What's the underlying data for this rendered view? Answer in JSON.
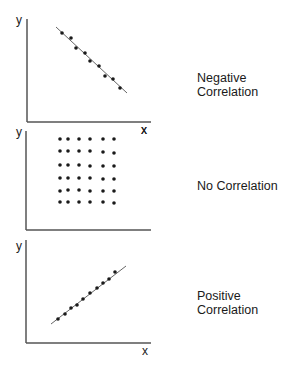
{
  "panels": [
    {
      "id": "negative",
      "caption_lines": [
        "Negative",
        "Correlation"
      ],
      "y_label": "y",
      "x_label": "x",
      "axis": {
        "x0": 27,
        "top": 19,
        "bottom": 122,
        "right": 151
      },
      "x_label_pos": [
        144,
        134
      ],
      "y_label_pos": [
        19,
        24
      ],
      "trend_line": [
        [
          56,
          27
        ],
        [
          127,
          93
        ]
      ],
      "points": [
        [
          62,
          33
        ],
        [
          71,
          38
        ],
        [
          76,
          48
        ],
        [
          85,
          53
        ],
        [
          90,
          61
        ],
        [
          99,
          66
        ],
        [
          105,
          76
        ],
        [
          113,
          79
        ],
        [
          120,
          88
        ]
      ],
      "caption_pos": [
        197,
        72
      ]
    },
    {
      "id": "none",
      "caption_lines": [
        "No Correlation"
      ],
      "y_label": "y",
      "x_label": "x",
      "axis": {
        "x0": 26,
        "top": 131,
        "bottom": 230,
        "right": 151
      },
      "x_label_pos": [
        144,
        134
      ],
      "y_label_pos": [
        19,
        136
      ],
      "points": [
        [
          60,
          139
        ],
        [
          68,
          139
        ],
        [
          79,
          139
        ],
        [
          90,
          139
        ],
        [
          103,
          139
        ],
        [
          114,
          139
        ],
        [
          60,
          151
        ],
        [
          68,
          151
        ],
        [
          79,
          151
        ],
        [
          90,
          151
        ],
        [
          103,
          152
        ],
        [
          114,
          153
        ],
        [
          60,
          165
        ],
        [
          68,
          165
        ],
        [
          79,
          165
        ],
        [
          90,
          166
        ],
        [
          103,
          166
        ],
        [
          114,
          166
        ],
        [
          60,
          178
        ],
        [
          68,
          178
        ],
        [
          79,
          178
        ],
        [
          90,
          178
        ],
        [
          103,
          179
        ],
        [
          114,
          179
        ],
        [
          60,
          191
        ],
        [
          68,
          190
        ],
        [
          79,
          190
        ],
        [
          90,
          191
        ],
        [
          103,
          191
        ],
        [
          114,
          191
        ],
        [
          60,
          202
        ],
        [
          68,
          202
        ],
        [
          79,
          202
        ],
        [
          90,
          202
        ],
        [
          103,
          202
        ],
        [
          114,
          203
        ]
      ],
      "caption_pos": [
        197,
        180
      ]
    },
    {
      "id": "positive",
      "caption_lines": [
        "Positive",
        "Correlation"
      ],
      "y_label": "y",
      "x_label": "x",
      "axis": {
        "x0": 26,
        "top": 240,
        "bottom": 343,
        "right": 151
      },
      "x_label_pos": [
        145,
        355
      ],
      "y_label_pos": [
        19,
        250
      ],
      "trend_line": [
        [
          51,
          324
        ],
        [
          126,
          266
        ]
      ],
      "points": [
        [
          58,
          319
        ],
        [
          65,
          314
        ],
        [
          71,
          308
        ],
        [
          77,
          305
        ],
        [
          83,
          299
        ],
        [
          90,
          293
        ],
        [
          97,
          288
        ],
        [
          103,
          283
        ],
        [
          109,
          279
        ],
        [
          115,
          272
        ]
      ],
      "caption_pos": [
        197,
        290
      ]
    }
  ],
  "labels": {
    "negative_line1": "Negative",
    "negative_line2": "Correlation",
    "none_line1": "No Correlation",
    "positive_line1": "Positive",
    "positive_line2": "Correlation",
    "x": "x",
    "y": "y"
  },
  "colors": {
    "ink": "#1a1a1a",
    "axis": "#555555",
    "trend": "#666666"
  }
}
